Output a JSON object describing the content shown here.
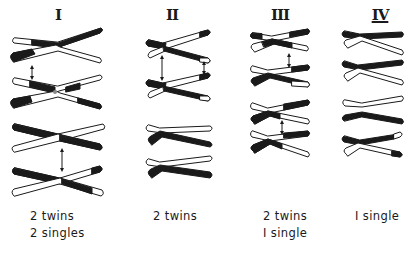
{
  "diagram": {
    "colors": {
      "ink": "#1a1a1a",
      "paper": "#ffffff"
    },
    "groups": [
      {
        "id": "I",
        "label": "I",
        "cx": 58,
        "captions": [
          "2 twins",
          "2 singles"
        ],
        "caption_x": 30,
        "bivalents": [
          {
            "y": 47,
            "type": "x",
            "x1": 10,
            "x2": 102,
            "cross": 57,
            "a": {
              "left": "white",
              "leftDark": 0.55,
              "right": "black"
            },
            "b": {
              "left": "black",
              "leftDarkEnd": 0.58,
              "right": "white"
            }
          },
          {
            "y": 87,
            "type": "x",
            "x1": 10,
            "x2": 102,
            "cross": 57,
            "a": {
              "left": "white",
              "leftDark": 0.55,
              "rightPattern": "black-end"
            },
            "b": {
              "leftPattern": "black-start",
              "rightPattern": "black-end"
            }
          },
          {
            "y": 134,
            "type": "x",
            "x1": 10,
            "x2": 102,
            "cross": 60,
            "a": {
              "left": "black",
              "right": "white"
            },
            "b": {
              "left": "white",
              "right": "black"
            }
          },
          {
            "y": 178,
            "type": "x",
            "x1": 10,
            "x2": 102,
            "cross": 60,
            "a": {
              "left": "black",
              "rightPattern": "black-end"
            },
            "b": {
              "left": "white",
              "rightPattern": "black-tip-white"
            }
          }
        ],
        "arrows": [
          {
            "x": 32,
            "y1": 66,
            "y2": 78
          },
          {
            "x": 62,
            "y1": 149,
            "y2": 170
          }
        ]
      },
      {
        "id": "II",
        "label": "II",
        "cx": 172,
        "captions": [
          "2 twins"
        ],
        "caption_x": 153,
        "bivalents": [
          {
            "y": 47
          },
          {
            "y": 86
          },
          {
            "y": 131
          },
          {
            "y": 166
          }
        ],
        "arrows": [
          {
            "x": 162,
            "y1": 56,
            "y2": 78
          },
          {
            "x": 204,
            "y1": 62,
            "y2": 74
          }
        ]
      },
      {
        "id": "III",
        "label": "III",
        "cx": 280,
        "captions": [
          "2 twins",
          "I single"
        ],
        "caption_x": 263,
        "bivalents": [
          {
            "y": 42
          },
          {
            "y": 76
          },
          {
            "y": 113
          },
          {
            "y": 142
          }
        ],
        "arrows": [
          {
            "x": 289,
            "y1": 54,
            "y2": 66
          },
          {
            "x": 282,
            "y1": 121,
            "y2": 134
          }
        ]
      },
      {
        "id": "IV",
        "label": "IV",
        "cx": 380,
        "captions": [
          "I single"
        ],
        "caption_x": 353,
        "bivalents": [
          {
            "y": 40
          },
          {
            "y": 71
          },
          {
            "y": 102
          },
          {
            "y": 130
          },
          {
            "y": 148
          }
        ],
        "arrows": []
      }
    ]
  }
}
